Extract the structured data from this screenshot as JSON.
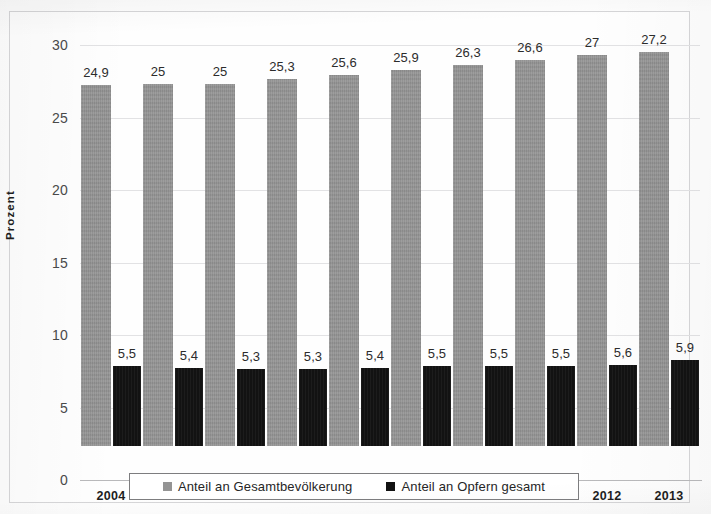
{
  "chart_data": {
    "type": "bar",
    "title": "",
    "xlabel": "",
    "ylabel": "Prozent",
    "ylim": [
      0,
      30
    ],
    "ytick_values": [
      0,
      5,
      10,
      15,
      20,
      25,
      30
    ],
    "ytick_labels": [
      "0",
      "5",
      "10",
      "15",
      "20",
      "25",
      "30"
    ],
    "grid": true,
    "legend_position": "bottom",
    "decimal_separator": ",",
    "categories": [
      "2004",
      "2005",
      "2006",
      "2007",
      "2008",
      "2009",
      "2010",
      "2011",
      "2012",
      "2013"
    ],
    "series": [
      {
        "name": "Anteil an Gesamtbevölkerung",
        "color": "#949494",
        "values": [
          24.9,
          25,
          25,
          25.3,
          25.6,
          25.9,
          26.3,
          26.6,
          27,
          27.2
        ],
        "labels": [
          "24,9",
          "25",
          "25",
          "25,3",
          "25,6",
          "25,9",
          "26,3",
          "26,6",
          "27",
          "27,2"
        ]
      },
      {
        "name": "Anteil an Opfern gesamt",
        "color": "#121212",
        "values": [
          5.5,
          5.4,
          5.3,
          5.3,
          5.4,
          5.5,
          5.5,
          5.5,
          5.6,
          5.9
        ],
        "labels": [
          "5,5",
          "5,4",
          "5,3",
          "5,3",
          "5,4",
          "5,5",
          "5,5",
          "5,5",
          "5,6",
          "5,9"
        ]
      }
    ]
  },
  "legend": {
    "entries": [
      {
        "label": "Anteil an Gesamtbevölkerung",
        "color": "#949494"
      },
      {
        "label": "Anteil an Opfern gesamt",
        "color": "#121212"
      }
    ]
  }
}
